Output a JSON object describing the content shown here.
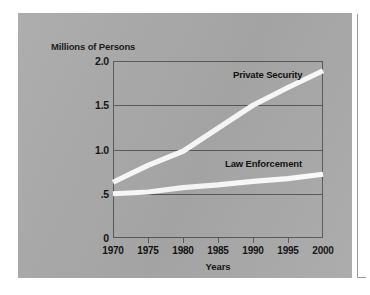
{
  "figure": {
    "panel_color": "#a9a9a9",
    "line_color": "#fdfdfd",
    "axis_color": "#55585c",
    "text_color": "#111111"
  },
  "chart_data": {
    "type": "line",
    "title": "",
    "xlabel": "Years",
    "ylabel": "Millions of Persons",
    "xlim": [
      1970,
      2000
    ],
    "ylim": [
      0,
      2.0
    ],
    "grid": true,
    "legend_position": "inline-annotation",
    "x": [
      1970,
      1975,
      1980,
      1985,
      1990,
      1995,
      2000
    ],
    "xtick_labels": [
      "1970",
      "1975",
      "1980",
      "1985",
      "1990",
      "1995",
      "2000"
    ],
    "ytick_values": [
      2.0,
      1.5,
      1.0,
      0.5,
      0
    ],
    "ytick_labels": [
      "2.0",
      "1.5",
      "1.0",
      ".5",
      "0"
    ],
    "series": [
      {
        "name": "Private Security",
        "values": [
          0.63,
          0.82,
          0.98,
          1.24,
          1.5,
          1.7,
          1.89
        ]
      },
      {
        "name": "Law Enforcement",
        "values": [
          0.5,
          0.52,
          0.57,
          0.6,
          0.64,
          0.67,
          0.72
        ]
      }
    ],
    "annotations": [
      {
        "text": "Private Security",
        "x": 1987,
        "y": 1.93
      },
      {
        "text": "Law Enforcement",
        "x": 1986,
        "y": 0.92
      }
    ]
  }
}
